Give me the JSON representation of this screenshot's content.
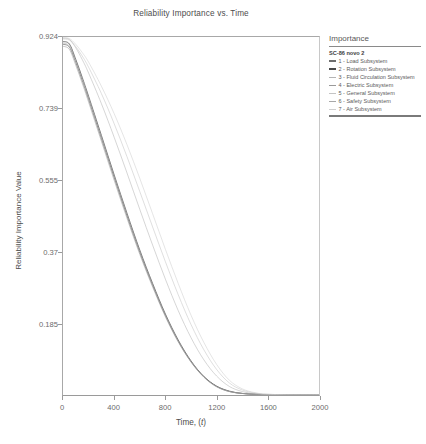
{
  "chart": {
    "title": "Reliability Importance vs. Time",
    "xlabel_prefix": "Time, (",
    "xlabel_var": "t",
    "xlabel_suffix": ")",
    "ylabel": "Reliability Importance Value"
  },
  "legend": {
    "title": "Importance",
    "group_name": "SC-86 novo 2",
    "entries": [
      {
        "label": "1 - Load Subsystem",
        "color": "#6e6e6e",
        "weight": "thick"
      },
      {
        "label": "2 - Rotation Subsystem",
        "color": "#4a4a4a",
        "weight": "thick"
      },
      {
        "label": "3 - Fluid Circulation Subsystem",
        "color": "#b4b4b4",
        "weight": "thin"
      },
      {
        "label": "4 - Electric Subsystem",
        "color": "#9a9a9a",
        "weight": "thin"
      },
      {
        "label": "5 - General Subsystem",
        "color": "#c4c4c4",
        "weight": "thin"
      },
      {
        "label": "6 - Safety Subsystem",
        "color": "#a8a8a8",
        "weight": "thin"
      },
      {
        "label": "7 - Air Subsystem",
        "color": "#cfcfcf",
        "weight": "thin"
      }
    ]
  },
  "chart_data": {
    "type": "line",
    "title": "Reliability Importance vs. Time",
    "xlabel": "Time, (t)",
    "ylabel": "Reliability Importance Value",
    "xlim": [
      0,
      2000
    ],
    "ylim": [
      0,
      0.924
    ],
    "grid": false,
    "legend_position": "right",
    "xticks": [
      0,
      400,
      800,
      1200,
      1600,
      2000
    ],
    "xtick_labels": [
      "0",
      "400",
      "800",
      "1200",
      "1600",
      "2000"
    ],
    "yticks": [
      0.185,
      0.37,
      0.555,
      0.739,
      0.924
    ],
    "ytick_labels": [
      "0.185",
      "0.37",
      "0.555",
      "0.739",
      "0.924"
    ],
    "x": [
      0,
      50,
      100,
      150,
      200,
      300,
      400,
      500,
      600,
      700,
      800,
      900,
      1000,
      1100,
      1200,
      1300,
      1400,
      1500,
      1600,
      1800,
      2000
    ],
    "series": [
      {
        "name": "1 - Load Subsystem",
        "color": "#6e6e6e",
        "values": [
          0.905,
          0.898,
          0.858,
          0.812,
          0.763,
          0.662,
          0.561,
          0.462,
          0.368,
          0.283,
          0.205,
          0.139,
          0.086,
          0.047,
          0.022,
          0.009,
          0.004,
          0.002,
          0.001,
          0.0,
          0.0
        ]
      },
      {
        "name": "2 - Rotation Subsystem",
        "color": "#4a4a4a",
        "values": [
          0.912,
          0.906,
          0.866,
          0.82,
          0.771,
          0.67,
          0.568,
          0.469,
          0.374,
          0.288,
          0.209,
          0.142,
          0.088,
          0.048,
          0.023,
          0.01,
          0.004,
          0.002,
          0.001,
          0.0,
          0.0
        ]
      },
      {
        "name": "3 - Fluid Circulation Subsystem",
        "color": "#b4b4b4",
        "values": [
          0.921,
          0.918,
          0.896,
          0.866,
          0.831,
          0.752,
          0.665,
          0.573,
          0.479,
          0.387,
          0.299,
          0.218,
          0.148,
          0.091,
          0.049,
          0.022,
          0.009,
          0.003,
          0.001,
          0.0,
          0.0
        ]
      },
      {
        "name": "4 - Electric Subsystem",
        "color": "#9a9a9a",
        "values": [
          0.9,
          0.892,
          0.851,
          0.805,
          0.756,
          0.655,
          0.554,
          0.456,
          0.363,
          0.279,
          0.202,
          0.137,
          0.085,
          0.046,
          0.021,
          0.009,
          0.004,
          0.002,
          0.001,
          0.0,
          0.0
        ]
      },
      {
        "name": "5 - General Subsystem",
        "color": "#c4c4c4",
        "values": [
          0.919,
          0.916,
          0.899,
          0.875,
          0.846,
          0.778,
          0.7,
          0.615,
          0.525,
          0.434,
          0.344,
          0.259,
          0.182,
          0.117,
          0.066,
          0.031,
          0.013,
          0.005,
          0.002,
          0.0,
          0.0
        ]
      },
      {
        "name": "6 - Safety Subsystem",
        "color": "#a8a8a8",
        "values": [
          0.908,
          0.901,
          0.862,
          0.816,
          0.767,
          0.666,
          0.565,
          0.466,
          0.371,
          0.285,
          0.207,
          0.14,
          0.087,
          0.047,
          0.022,
          0.009,
          0.004,
          0.002,
          0.001,
          0.0,
          0.0
        ]
      },
      {
        "name": "7 - Air Subsystem",
        "color": "#cfcfcf",
        "values": [
          0.922,
          0.92,
          0.905,
          0.884,
          0.859,
          0.797,
          0.726,
          0.646,
          0.559,
          0.468,
          0.376,
          0.288,
          0.206,
          0.136,
          0.079,
          0.038,
          0.016,
          0.006,
          0.002,
          0.0,
          0.0
        ]
      }
    ]
  }
}
